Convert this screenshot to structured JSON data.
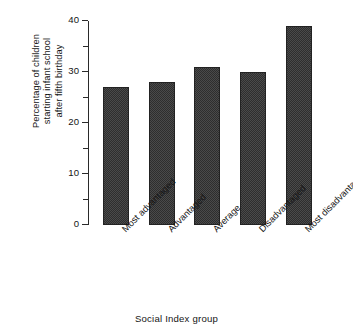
{
  "chart_data": {
    "type": "bar",
    "title": "",
    "categories": [
      "Most advantaged",
      "Advantaged",
      "Average",
      "Disadvantaged",
      "Most disadvantaged"
    ],
    "values": [
      27,
      28,
      31,
      30,
      39
    ],
    "xlabel": "Social Index group",
    "ylabel": "Percentage of children\nstarting infant school\nafter fifth birthday",
    "ylim": [
      0,
      40
    ],
    "ytick_labels": [
      "0",
      "10",
      "20",
      "30",
      "40"
    ],
    "ytick_values": [
      0,
      10,
      20,
      30,
      40
    ],
    "yminor_values": [
      5,
      15,
      25,
      35
    ],
    "grid": false,
    "legend": false,
    "bar_color": "#454545",
    "axis_color": "#2a2a2a"
  }
}
